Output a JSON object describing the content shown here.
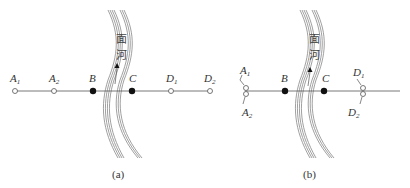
{
  "figure": {
    "panels": [
      {
        "id": "a",
        "caption": "(a)",
        "river_label_top": "面",
        "river_label_bottom": "河",
        "points": [
          {
            "name": "A",
            "sub": "1",
            "type": "open"
          },
          {
            "name": "A",
            "sub": "2",
            "type": "open"
          },
          {
            "name": "B",
            "sub": "",
            "type": "solid"
          },
          {
            "name": "C",
            "sub": "",
            "type": "solid"
          },
          {
            "name": "D",
            "sub": "1",
            "type": "open"
          },
          {
            "name": "D",
            "sub": "2",
            "type": "open"
          }
        ]
      },
      {
        "id": "b",
        "caption": "(b)",
        "river_label_top": "面",
        "river_label_bottom": "河",
        "points": [
          {
            "name": "A",
            "sub": "1",
            "type": "open"
          },
          {
            "name": "A",
            "sub": "2",
            "type": "open"
          },
          {
            "name": "B",
            "sub": "",
            "type": "solid"
          },
          {
            "name": "C",
            "sub": "",
            "type": "solid"
          },
          {
            "name": "D",
            "sub": "1",
            "type": "open"
          },
          {
            "name": "D",
            "sub": "2",
            "type": "open"
          }
        ]
      }
    ]
  }
}
